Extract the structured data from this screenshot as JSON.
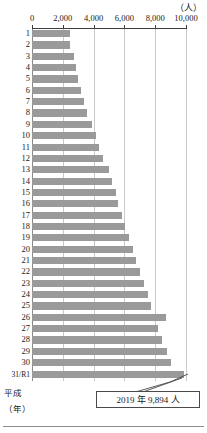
{
  "chart_data": {
    "type": "bar",
    "orientation": "horizontal",
    "title": "",
    "unit_label": "（人）",
    "xlabel": "",
    "ylabel": "",
    "era_caption": "平成",
    "year_caption": "（年）",
    "xlim": [
      0,
      10000
    ],
    "xticks": [
      0,
      2000,
      4000,
      6000,
      8000,
      10000
    ],
    "xtick_labels": [
      "0",
      "2,000",
      "4,000",
      "6,000",
      "8,000",
      "10,000"
    ],
    "grid": true,
    "legend": "none",
    "bar_color": "#9a9a9a",
    "categories": [
      "1",
      "2",
      "3",
      "4",
      "5",
      "6",
      "7",
      "8",
      "9",
      "10",
      "11",
      "12",
      "13",
      "14",
      "15",
      "16",
      "17",
      "18",
      "19",
      "20",
      "21",
      "22",
      "23",
      "24",
      "25",
      "26",
      "27",
      "28",
      "29",
      "30",
      "31/R1"
    ],
    "values": [
      2450,
      2480,
      2700,
      2830,
      3000,
      3150,
      3400,
      3600,
      3900,
      4150,
      4350,
      4600,
      5000,
      5200,
      5450,
      5600,
      5850,
      6050,
      6300,
      6550,
      6750,
      7000,
      7250,
      7500,
      7750,
      8700,
      8150,
      8450,
      8750,
      9000,
      9894
    ],
    "annotations": [
      {
        "name": "final-year-callout",
        "text": "2019 年  9,894 人",
        "target_category": "31/R1",
        "target_value": 9894
      }
    ]
  },
  "callout": {
    "label": "2019 年  9,894 人"
  }
}
